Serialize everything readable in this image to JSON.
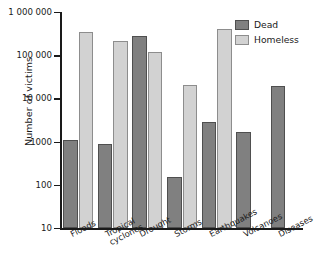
{
  "chart_data": {
    "type": "bar",
    "title": "",
    "xlabel": "",
    "ylabel": "Number of victims",
    "yscale": "log",
    "ylim": [
      10,
      1000000
    ],
    "ytick_labels": [
      "1 000 000",
      "100 000",
      "10 000",
      "1000",
      "100",
      "10"
    ],
    "ytick_values": [
      1000000,
      100000,
      10000,
      1000,
      100,
      10
    ],
    "grid": false,
    "legend_position": "top-right",
    "categories": [
      "Floods",
      "Tropical cyclones",
      "Drought",
      "Storms",
      "Earthquakes",
      "Volcanoes",
      "Diseases"
    ],
    "category_label_lines": [
      [
        "Floods"
      ],
      [
        "Tropical",
        "cyclones"
      ],
      [
        "Drought"
      ],
      [
        "Storms"
      ],
      [
        "Earthquakes"
      ],
      [
        "Volcanoes"
      ],
      [
        "Diseases"
      ]
    ],
    "series": [
      {
        "name": "Dead",
        "color": "#808080",
        "values": [
          1100,
          900,
          280000,
          150,
          2800,
          1700,
          19000
        ]
      },
      {
        "name": "Homeless",
        "color": "#d2d2d2",
        "values": [
          350000,
          210000,
          120000,
          20000,
          400000,
          null,
          null
        ]
      }
    ]
  },
  "legend": {
    "items": [
      {
        "label": "Dead",
        "key": "dead"
      },
      {
        "label": "Homeless",
        "key": "homeless"
      }
    ]
  }
}
